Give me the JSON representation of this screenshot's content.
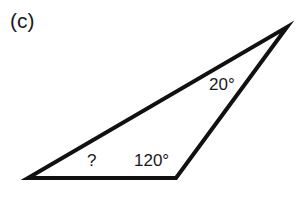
{
  "figure": {
    "panel_label": "(c)",
    "triangle": {
      "vertices": {
        "left": [
          28,
          178
        ],
        "bottom_right": [
          176,
          178
        ],
        "top": [
          287,
          27
        ]
      },
      "stroke_color": "#111111",
      "stroke_width": 4
    },
    "angles": {
      "top": "20°",
      "left": "?",
      "bottom_right": "120°"
    }
  }
}
